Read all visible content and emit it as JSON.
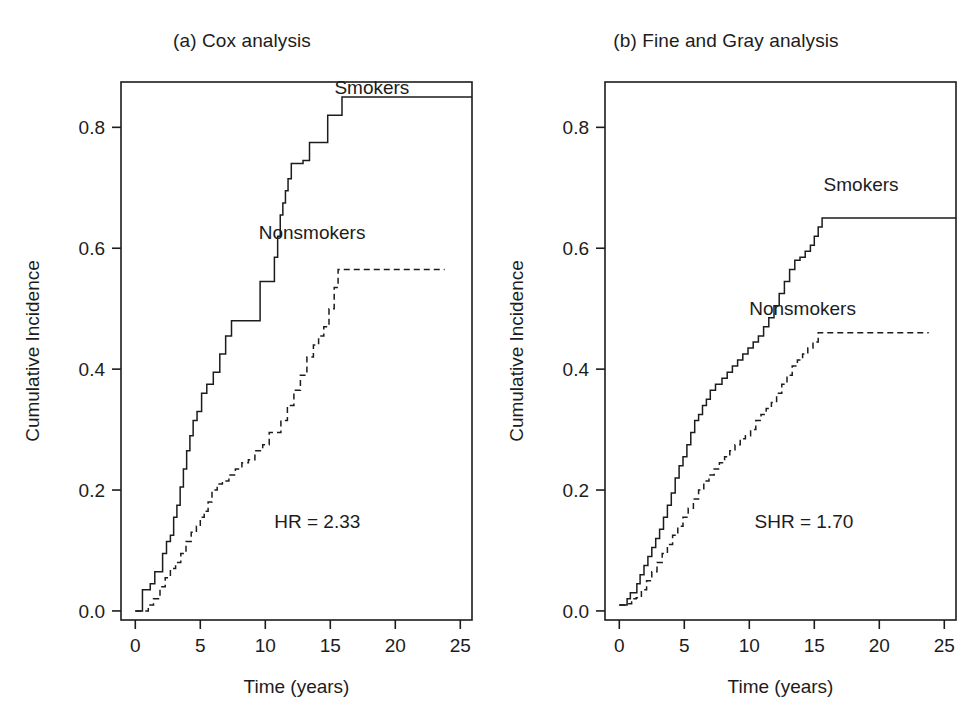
{
  "figure": {
    "background": "#ffffff",
    "ink_color": "#1c1c1c",
    "width": 968,
    "height": 726
  },
  "chart_data": [
    {
      "id": "panel-a",
      "type": "line",
      "title": "(a) Cox analysis",
      "xlabel": "Time (years)",
      "ylabel": "Cumulative Incidence",
      "xlim": [
        -1.1,
        25.9
      ],
      "ylim": [
        -0.015,
        0.875
      ],
      "grid": false,
      "xticks": [
        0,
        5,
        10,
        15,
        20,
        25
      ],
      "xticklabels": [
        "0",
        "5",
        "10",
        "15",
        "20",
        "25"
      ],
      "yticks": [
        0.0,
        0.2,
        0.4,
        0.6,
        0.8
      ],
      "yticklabels": [
        "0.0",
        "0.2",
        "0.4",
        "0.6",
        "0.8"
      ],
      "legend_position": "inside-curve-ends",
      "annotations": [
        {
          "name": "hazard-ratio",
          "text": "HR = 2.33",
          "x": 14.0,
          "y": 0.138
        }
      ],
      "series": [
        {
          "name": "Smokers",
          "style": "solid",
          "label_x": 18.2,
          "label_y": 0.855,
          "x": [
            0.0,
            0.35,
            0.55,
            0.9,
            1.15,
            1.5,
            1.8,
            2.1,
            2.4,
            2.7,
            2.95,
            3.2,
            3.45,
            3.7,
            3.95,
            4.2,
            4.45,
            4.75,
            5.1,
            5.5,
            6.0,
            6.5,
            6.95,
            7.4,
            8.5,
            9.6,
            10.3,
            10.7,
            10.95,
            11.15,
            11.35,
            11.55,
            11.75,
            12.0,
            12.4,
            12.9,
            13.4,
            14.1,
            14.8,
            15.4,
            15.9,
            25.9
          ],
          "y": [
            0.0,
            0.0,
            0.035,
            0.035,
            0.045,
            0.065,
            0.065,
            0.095,
            0.115,
            0.125,
            0.155,
            0.175,
            0.205,
            0.235,
            0.265,
            0.29,
            0.315,
            0.33,
            0.36,
            0.375,
            0.395,
            0.425,
            0.455,
            0.48,
            0.48,
            0.545,
            0.545,
            0.585,
            0.62,
            0.655,
            0.675,
            0.695,
            0.715,
            0.74,
            0.74,
            0.745,
            0.775,
            0.775,
            0.82,
            0.82,
            0.85,
            0.85
          ]
        },
        {
          "name": "Nonsmokers",
          "style": "dashed",
          "label_x": 13.6,
          "label_y": 0.615,
          "x": [
            0.0,
            0.6,
            1.0,
            1.4,
            1.9,
            2.3,
            2.7,
            3.1,
            3.5,
            3.9,
            4.3,
            4.7,
            5.0,
            5.3,
            5.6,
            5.9,
            6.3,
            6.7,
            7.2,
            7.7,
            8.2,
            8.7,
            9.2,
            9.8,
            10.3,
            10.8,
            11.2,
            11.7,
            12.2,
            12.7,
            13.2,
            13.7,
            14.1,
            14.5,
            14.9,
            15.3,
            15.6,
            23.8
          ],
          "y": [
            0.0,
            0.0,
            0.01,
            0.02,
            0.04,
            0.055,
            0.07,
            0.08,
            0.095,
            0.115,
            0.13,
            0.14,
            0.155,
            0.165,
            0.18,
            0.2,
            0.21,
            0.215,
            0.225,
            0.235,
            0.245,
            0.25,
            0.265,
            0.275,
            0.295,
            0.295,
            0.315,
            0.34,
            0.365,
            0.39,
            0.42,
            0.44,
            0.455,
            0.47,
            0.5,
            0.535,
            0.565,
            0.565
          ]
        }
      ]
    },
    {
      "id": "panel-b",
      "type": "line",
      "title": "(b) Fine and Gray analysis",
      "xlabel": "Time (years)",
      "ylabel": "Cumulative Incidence",
      "xlim": [
        -1.1,
        25.9
      ],
      "ylim": [
        -0.015,
        0.875
      ],
      "grid": false,
      "xticks": [
        0,
        5,
        10,
        15,
        20,
        25
      ],
      "xticklabels": [
        "0",
        "5",
        "10",
        "15",
        "20",
        "25"
      ],
      "yticks": [
        0.0,
        0.2,
        0.4,
        0.6,
        0.8
      ],
      "yticklabels": [
        "0.0",
        "0.2",
        "0.4",
        "0.6",
        "0.8"
      ],
      "legend_position": "inside-curve-ends",
      "annotations": [
        {
          "name": "subdistribution-hazard-ratio",
          "text": "SHR = 1.70",
          "x": 14.2,
          "y": 0.138
        }
      ],
      "series": [
        {
          "name": "Smokers",
          "style": "solid",
          "label_x": 18.6,
          "label_y": 0.695,
          "x": [
            0.0,
            0.35,
            0.6,
            0.85,
            1.1,
            1.35,
            1.6,
            1.9,
            2.2,
            2.5,
            2.8,
            3.1,
            3.4,
            3.7,
            4.0,
            4.3,
            4.6,
            4.9,
            5.2,
            5.5,
            5.8,
            6.1,
            6.4,
            6.7,
            7.0,
            7.4,
            7.9,
            8.3,
            8.7,
            9.1,
            9.5,
            9.9,
            10.3,
            10.7,
            11.1,
            11.5,
            11.9,
            12.3,
            12.7,
            13.1,
            13.5,
            13.9,
            14.3,
            14.7,
            15.0,
            15.3,
            15.6,
            15.9,
            25.9
          ],
          "y": [
            0.01,
            0.01,
            0.02,
            0.03,
            0.03,
            0.045,
            0.06,
            0.075,
            0.09,
            0.105,
            0.12,
            0.135,
            0.155,
            0.175,
            0.195,
            0.22,
            0.24,
            0.255,
            0.275,
            0.295,
            0.315,
            0.325,
            0.34,
            0.35,
            0.365,
            0.375,
            0.385,
            0.395,
            0.405,
            0.415,
            0.425,
            0.435,
            0.445,
            0.455,
            0.47,
            0.485,
            0.505,
            0.525,
            0.545,
            0.565,
            0.58,
            0.585,
            0.595,
            0.605,
            0.62,
            0.635,
            0.65,
            0.65,
            0.65
          ]
        },
        {
          "name": "Nonsmokers",
          "style": "dashed",
          "label_x": 14.1,
          "label_y": 0.49,
          "x": [
            0.0,
            0.5,
            0.95,
            1.3,
            1.7,
            2.1,
            2.5,
            2.9,
            3.3,
            3.7,
            4.1,
            4.5,
            4.9,
            5.3,
            5.7,
            6.1,
            6.5,
            6.9,
            7.3,
            7.7,
            8.1,
            8.5,
            8.9,
            9.3,
            9.7,
            10.1,
            10.5,
            10.9,
            11.3,
            11.7,
            12.1,
            12.5,
            12.9,
            13.3,
            13.7,
            14.1,
            14.5,
            14.9,
            15.3,
            15.6,
            23.8
          ],
          "y": [
            0.01,
            0.012,
            0.02,
            0.022,
            0.035,
            0.05,
            0.065,
            0.08,
            0.095,
            0.11,
            0.125,
            0.14,
            0.155,
            0.17,
            0.185,
            0.2,
            0.215,
            0.225,
            0.235,
            0.245,
            0.255,
            0.265,
            0.275,
            0.285,
            0.29,
            0.3,
            0.315,
            0.325,
            0.335,
            0.345,
            0.36,
            0.375,
            0.39,
            0.405,
            0.415,
            0.425,
            0.435,
            0.445,
            0.46,
            0.46,
            0.46
          ]
        }
      ]
    }
  ],
  "panels": {
    "a": {
      "title": "(a) Cox analysis",
      "xlabel": "Time (years)",
      "ylabel": "Cumulative Incidence",
      "smokers_label": "Smokers",
      "nonsmokers_label": "Nonsmokers",
      "stat_label": "HR = 2.33"
    },
    "b": {
      "title": "(b) Fine and Gray analysis",
      "xlabel": "Time (years)",
      "ylabel": "Cumulative Incidence",
      "smokers_label": "Smokers",
      "nonsmokers_label": "Nonsmokers",
      "stat_label": "SHR = 1.70"
    }
  }
}
